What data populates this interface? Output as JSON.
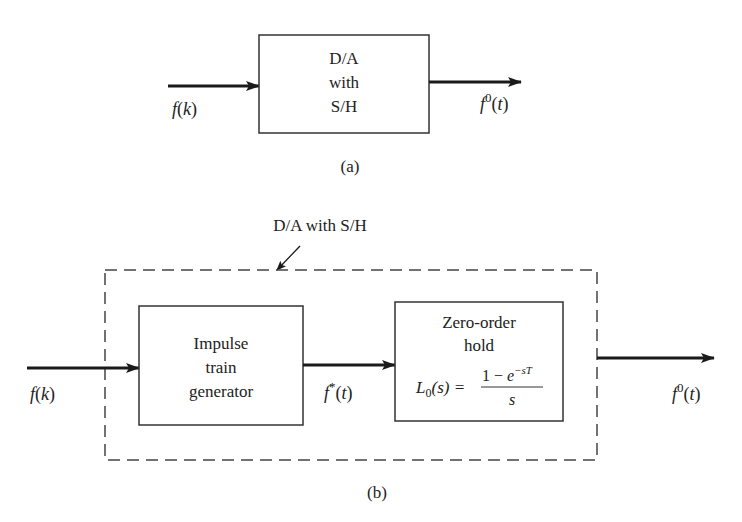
{
  "figure_a": {
    "caption": "(a)",
    "block": {
      "line1": "D/A",
      "line2": "with",
      "line3": "S/H"
    },
    "input_label": {
      "base": "f",
      "open": "(",
      "arg": "k",
      "close": ")"
    },
    "output_label": {
      "base": "f",
      "sup": "0",
      "open": "(",
      "arg": "t",
      "close": ")"
    }
  },
  "figure_b": {
    "caption": "(b)",
    "group_label": "D/A with S/H",
    "input_label": {
      "base": "f",
      "open": "(",
      "arg": "k",
      "close": ")"
    },
    "impulse_block": {
      "line1": "Impulse",
      "line2": "train",
      "line3": "generator"
    },
    "intermediate_label": {
      "base": "f",
      "sup": "*",
      "open": "(",
      "arg": "t",
      "close": ")"
    },
    "zoh_block": {
      "line1": "Zero-order",
      "line2": "hold",
      "formula": {
        "lhs_base": "L",
        "lhs_sub": "0",
        "lhs_arg": "(s) =",
        "numerator_one": "1 − ",
        "numerator_e": "e",
        "numerator_exp": "−sT",
        "denominator": "s"
      }
    },
    "output_label": {
      "base": "f",
      "sup": "0",
      "open": "(",
      "arg": "t",
      "close": ")"
    }
  }
}
